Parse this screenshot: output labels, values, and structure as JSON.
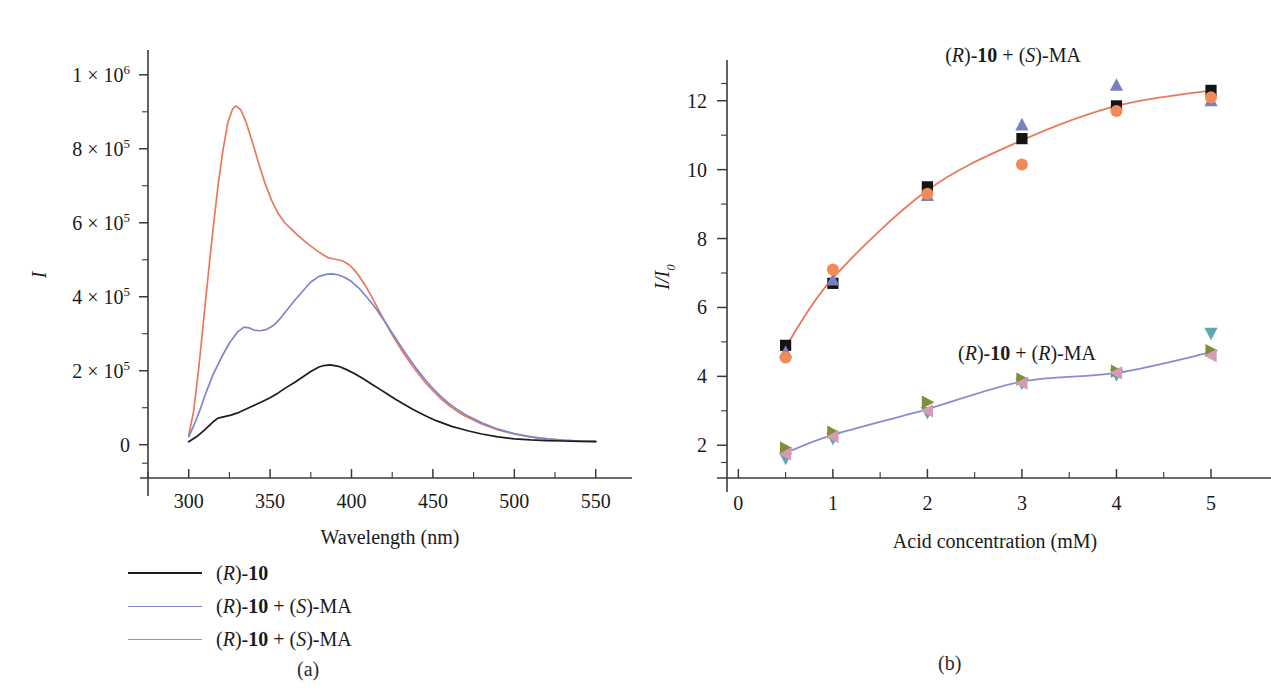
{
  "figure": {
    "panels": [
      {
        "id": "a",
        "caption": "(a)",
        "axes": {
          "x_title": "Wavelength (nm)",
          "x_ticks": [
            "300",
            "350",
            "400",
            "450",
            "500",
            "550"
          ],
          "x_tick_values": [
            300,
            350,
            400,
            450,
            500,
            550
          ],
          "y_title": "I",
          "y_ticks": [
            "0",
            "2 × 10^5",
            "4 × 10^5",
            "6 × 10^5",
            "8 × 10^5",
            "1 × 10^6"
          ],
          "y_tick_mantissas": [
            "0",
            "2 × 10",
            "4 × 10",
            "6 × 10",
            "8 × 10",
            "1 × 10"
          ],
          "y_tick_exponents": [
            "",
            "5",
            "5",
            "5",
            "5",
            "6"
          ],
          "y_tick_values": [
            0,
            200000,
            400000,
            600000,
            800000,
            1000000
          ],
          "xlim": [
            275,
            560
          ],
          "ylim": [
            -90000,
            1040000
          ]
        },
        "legend": [
          {
            "label_plain": "(R)-10",
            "color": "#1c1c1c"
          },
          {
            "label_plain": "(R)-10 + (S)-MA",
            "color": "#7f86c8"
          },
          {
            "label_plain": "(R)-10 + (S)-MA",
            "color": "#e8795c"
          }
        ]
      },
      {
        "id": "b",
        "caption": "(b)",
        "axes": {
          "x_title": "Acid concentration (mM)",
          "x_ticks": [
            "0",
            "1",
            "2",
            "3",
            "4",
            "5"
          ],
          "x_tick_values": [
            0,
            1,
            2,
            3,
            4,
            5
          ],
          "y_title": "I/I0",
          "y_title_main": "I/I",
          "y_title_sub": "0",
          "y_ticks": [
            "2",
            "4",
            "6",
            "8",
            "10",
            "12"
          ],
          "y_tick_values": [
            2,
            4,
            6,
            8,
            10,
            12
          ],
          "xlim": [
            -0.12,
            5.55
          ],
          "ylim": [
            1.05,
            12.95
          ]
        },
        "annotations": [
          {
            "text_plain": "(R)-10 + (S)-MA",
            "x_px": 1014,
            "y_px": 22
          },
          {
            "text_plain": "(R)-10 + (R)-MA",
            "x_px": 1028,
            "y_px": 320
          }
        ]
      }
    ]
  },
  "chart_data": [
    {
      "type": "line",
      "panel": "a",
      "title": "",
      "xlabel": "Wavelength (nm)",
      "ylabel": "I",
      "xlim": [
        275,
        560
      ],
      "ylim": [
        -90000,
        1040000
      ],
      "grid": false,
      "legend_position": "below-left",
      "series": [
        {
          "name": "(R)-10",
          "color": "#1c1c1c",
          "x": [
            300,
            305,
            310,
            315,
            318,
            322,
            326,
            330,
            335,
            340,
            345,
            350,
            355,
            360,
            365,
            370,
            375,
            380,
            383,
            387,
            392,
            397,
            402,
            407,
            412,
            417,
            422,
            427,
            432,
            437,
            442,
            447,
            452,
            457,
            462,
            467,
            472,
            480,
            490,
            500,
            510,
            520,
            530,
            540,
            550
          ],
          "y": [
            8000,
            22000,
            41000,
            62000,
            72000,
            76000,
            80000,
            86000,
            96000,
            106000,
            116000,
            127000,
            140000,
            155000,
            168000,
            183000,
            198000,
            210000,
            214000,
            216000,
            212000,
            203000,
            192000,
            179000,
            165000,
            151000,
            137000,
            123000,
            110000,
            97000,
            86000,
            75000,
            65000,
            57000,
            49000,
            43000,
            37000,
            29000,
            21000,
            16000,
            13000,
            11000,
            10000,
            9000,
            8500
          ]
        },
        {
          "name": "(R)-10 + (S)-MA",
          "color": "#7f86c8",
          "x": [
            300,
            303,
            307,
            311,
            315,
            320,
            325,
            330,
            334,
            337,
            340,
            344,
            348,
            352,
            356,
            360,
            365,
            370,
            375,
            380,
            385,
            388,
            392,
            396,
            400,
            405,
            410,
            415,
            420,
            425,
            430,
            435,
            440,
            445,
            450,
            455,
            460,
            465,
            470,
            480,
            490,
            500,
            510,
            520,
            530,
            540,
            550
          ],
          "y": [
            22000,
            50000,
            95000,
            145000,
            190000,
            235000,
            275000,
            305000,
            318000,
            316000,
            310000,
            308000,
            312000,
            322000,
            340000,
            362000,
            390000,
            415000,
            440000,
            455000,
            461000,
            462000,
            459000,
            452000,
            441000,
            421000,
            396000,
            368000,
            336000,
            302000,
            268000,
            236000,
            205000,
            177000,
            152000,
            130000,
            111000,
            95000,
            81000,
            59000,
            42000,
            30000,
            21000,
            16000,
            12000,
            10000,
            9000
          ]
        },
        {
          "name": "(R)-10 + (S)-MA",
          "color": "#e8795c",
          "x": [
            300,
            303,
            306,
            309,
            312,
            315,
            318,
            321,
            324,
            327,
            329,
            332,
            335,
            339,
            343,
            347,
            351,
            355,
            359,
            363,
            367,
            371,
            375,
            379,
            383,
            386,
            389,
            392,
            395,
            398,
            401,
            404,
            408,
            412,
            416,
            420,
            425,
            430,
            435,
            440,
            445,
            450,
            455,
            460,
            465,
            470,
            480,
            490,
            500,
            510,
            520,
            530,
            540,
            550
          ],
          "y": [
            25000,
            90000,
            200000,
            330000,
            460000,
            585000,
            700000,
            795000,
            870000,
            908000,
            916000,
            905000,
            875000,
            820000,
            760000,
            705000,
            660000,
            625000,
            600000,
            583000,
            566000,
            551000,
            537000,
            524000,
            512000,
            505000,
            502000,
            500000,
            496000,
            488000,
            476000,
            460000,
            434000,
            403000,
            370000,
            337000,
            297000,
            261000,
            228000,
            198000,
            170000,
            146000,
            124000,
            106000,
            90000,
            77000,
            56000,
            40000,
            29000,
            21000,
            16000,
            12500,
            10000,
            9000
          ]
        }
      ]
    },
    {
      "type": "scatter",
      "panel": "b",
      "title": "",
      "xlabel": "Acid concentration (mM)",
      "ylabel": "I/I0",
      "xlim": [
        -0.12,
        5.55
      ],
      "ylim": [
        1.05,
        12.95
      ],
      "grid": false,
      "legend_position": "inline-annotations",
      "groups": [
        {
          "name": "(R)-10 + (S)-MA",
          "fit_color": "#e8795c",
          "categories": [
            0.5,
            1,
            2,
            3,
            4,
            5
          ],
          "fit_values": [
            4.85,
            6.85,
            9.4,
            10.85,
            11.85,
            12.3
          ],
          "series": [
            {
              "name": "run-1-square",
              "marker": "square",
              "color": "#141414",
              "values": [
                4.9,
                6.7,
                9.5,
                10.9,
                11.85,
                12.3
              ]
            },
            {
              "name": "run-2-triangle-up",
              "marker": "triangle-up",
              "color": "#7a7fc0",
              "values": [
                4.7,
                6.8,
                9.25,
                11.3,
                12.45,
                12.0
              ]
            },
            {
              "name": "run-3-circle",
              "marker": "circle",
              "color": "#f08a57",
              "values": [
                4.55,
                7.1,
                9.3,
                10.15,
                11.7,
                12.1
              ]
            }
          ]
        },
        {
          "name": "(R)-10 + (R)-MA",
          "fit_color": "#8b8ccb",
          "categories": [
            0.5,
            1,
            2,
            3,
            4,
            5
          ],
          "fit_values": [
            1.78,
            2.3,
            3.05,
            3.85,
            4.1,
            4.7
          ],
          "series": [
            {
              "name": "run-1-triangle-down",
              "marker": "triangle-down",
              "color": "#5aa8b4",
              "values": [
                1.62,
                2.2,
                2.95,
                3.8,
                4.05,
                5.25
              ]
            },
            {
              "name": "run-2-triangle-right",
              "marker": "triangle-right",
              "color": "#7d8f38",
              "values": [
                1.92,
                2.38,
                3.25,
                3.92,
                4.15,
                4.75
              ]
            },
            {
              "name": "run-3-triangle-left",
              "marker": "triangle-left",
              "color": "#d79ab4",
              "values": [
                1.75,
                2.25,
                3.0,
                3.8,
                4.1,
                4.6
              ]
            }
          ]
        }
      ]
    }
  ]
}
